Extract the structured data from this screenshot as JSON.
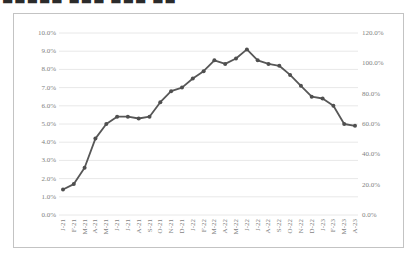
{
  "page": {
    "cropped_title_fragments": "■■■■■ ■■■ ■■■ ■■"
  },
  "chart_data": {
    "type": "line",
    "title": "",
    "x_labels": [
      "J-21",
      "F-21",
      "M-21",
      "A-21",
      "M-21",
      "J-21",
      "J-21",
      "A-21",
      "S-21",
      "O-21",
      "N-21",
      "D-21",
      "J-22",
      "F-22",
      "M-22",
      "A-22",
      "M-22",
      "J-22",
      "J-22",
      "A-22",
      "S-22",
      "O-22",
      "N-22",
      "D-22",
      "J-23",
      "F-23",
      "M-23",
      "A-23"
    ],
    "series": [
      {
        "name": "value-pct",
        "values": [
          1.4,
          1.7,
          2.6,
          4.2,
          5.0,
          5.4,
          5.4,
          5.3,
          5.4,
          6.2,
          6.8,
          7.0,
          7.5,
          7.9,
          8.5,
          8.3,
          8.6,
          9.1,
          8.5,
          8.3,
          8.2,
          7.7,
          7.1,
          6.5,
          6.4,
          6.0,
          5.0,
          4.9
        ]
      }
    ],
    "left_axis": {
      "min": 0,
      "max": 10,
      "tick_labels": [
        "10.0%",
        "9.0%",
        "8.0%",
        "7.0%",
        "6.0%",
        "5.0%",
        "4.0%",
        "3.0%",
        "2.0%",
        "1.0%",
        "0.0%"
      ]
    },
    "right_axis": {
      "min": 0,
      "max": 120,
      "tick_labels": [
        "120.0%",
        "100.0%",
        "80.0%",
        "60.0%",
        "40.0%",
        "20.0%",
        "0.0%"
      ]
    },
    "grid": true,
    "legend": "none",
    "colors": {
      "line": "#575757",
      "marker": "#4f4f4f",
      "gridline": "#e8e8e8",
      "border": "#c3c3c3",
      "axis_text": "#7f7f7f"
    }
  }
}
